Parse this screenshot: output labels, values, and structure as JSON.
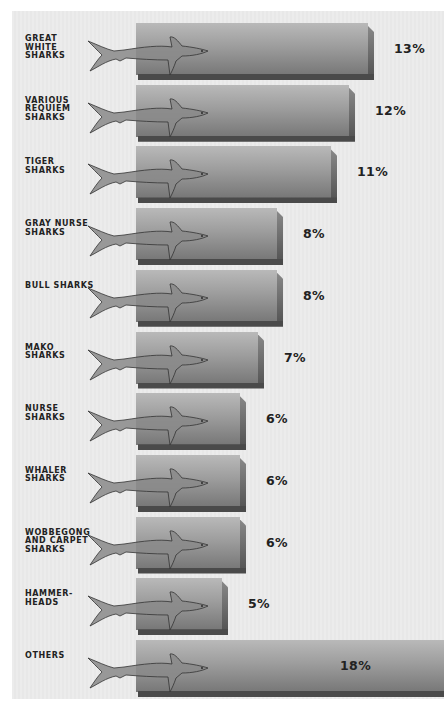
{
  "chart_data": {
    "type": "bar",
    "orientation": "horizontal",
    "title": "",
    "xlabel": "",
    "ylabel": "",
    "grid": false,
    "legend": null,
    "categories": [
      "GREAT WHITE SHARKS",
      "VARIOUS REQUIEM SHARKS",
      "TIGER SHARKS",
      "GRAY NURSE SHARKS",
      "BULL SHARKS",
      "MAKO SHARKS",
      "NURSE SHARKS",
      "WHALER SHARKS",
      "WOBBEGONG AND CARPET SHARKS",
      "HAMMERHEADS",
      "OTHERS"
    ],
    "values": [
      13,
      12,
      11,
      8,
      8,
      7,
      6,
      6,
      6,
      5,
      18
    ],
    "unit": "%",
    "xlim": [
      0,
      18
    ]
  },
  "rows": [
    {
      "label": "GREAT\nWHITE SHARKS",
      "value_label": "13%",
      "icon": "great-white-shark-icon"
    },
    {
      "label": "VARIOUS\nREQUIEM\nSHARKS",
      "value_label": "12%",
      "icon": "requiem-shark-icon"
    },
    {
      "label": "TIGER SHARKS",
      "value_label": "11%",
      "icon": "tiger-shark-icon"
    },
    {
      "label": "GRAY NURSE\nSHARKS",
      "value_label": "8%",
      "icon": "gray-nurse-shark-icon"
    },
    {
      "label": "BULL SHARKS",
      "value_label": "8%",
      "icon": "bull-shark-icon"
    },
    {
      "label": "MAKO\nSHARKS",
      "value_label": "7%",
      "icon": "mako-shark-icon"
    },
    {
      "label": "NURSE\nSHARKS",
      "value_label": "6%",
      "icon": "nurse-shark-icon"
    },
    {
      "label": "WHALER\nSHARKS",
      "value_label": "6%",
      "icon": "whaler-shark-icon"
    },
    {
      "label": "WOBBEGONG\nAND CARPET\nSHARKS",
      "value_label": "6%",
      "icon": "wobbegong-shark-icon"
    },
    {
      "label": "HAMMER-\nHEADS",
      "value_label": "5%",
      "icon": "hammerhead-shark-icon"
    },
    {
      "label": "OTHERS",
      "value_label": "18%",
      "icon": "other-shark-icon"
    }
  ],
  "colors": {
    "background": "#ececec",
    "bar_light": "#b9b9b9",
    "bar_dark": "#777777",
    "bar_edge": "#4a4a4a",
    "shark_fill": "#8a8a8a",
    "text": "#222222"
  }
}
